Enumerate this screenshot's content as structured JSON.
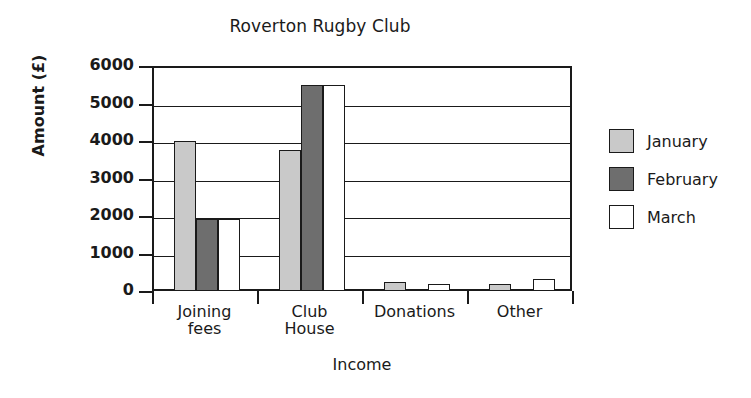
{
  "chart_data": {
    "type": "bar",
    "title": "Roverton Rugby Club",
    "xlabel": "Income",
    "ylabel": "Amount (£)",
    "categories": [
      "Joining\nfees",
      "Club\nHouse",
      "Donations",
      "Other"
    ],
    "series": [
      {
        "name": "January",
        "color": "#c9c9c9",
        "values": [
          4000,
          3750,
          250,
          200
        ]
      },
      {
        "name": "February",
        "color": "#6e6e6e",
        "values": [
          1920,
          5500,
          0,
          50
        ]
      },
      {
        "name": "March",
        "color": "#ffffff",
        "values": [
          1920,
          5500,
          180,
          330
        ]
      }
    ],
    "ylim": [
      0,
      6000
    ],
    "yticks": [
      0,
      1000,
      2000,
      3000,
      4000,
      5000,
      6000
    ],
    "ytick_labels": [
      "0",
      "1000",
      "2000",
      "3000",
      "4000",
      "5000",
      "6000"
    ],
    "grid": true,
    "grid_axis": "y",
    "legend_position": "right",
    "axis_color": "#1a1a1a",
    "background": "#ffffff"
  },
  "axis": {
    "y_title": "Amount (£)",
    "x_title": "Income"
  },
  "legend": {
    "items": [
      {
        "label": "January"
      },
      {
        "label": "February"
      },
      {
        "label": "March"
      }
    ]
  },
  "categories": [
    {
      "line1": "Joining",
      "line2": "fees"
    },
    {
      "line1": "Club",
      "line2": "House"
    },
    {
      "line1": "Donations",
      "line2": ""
    },
    {
      "line1": "Other",
      "line2": ""
    }
  ]
}
